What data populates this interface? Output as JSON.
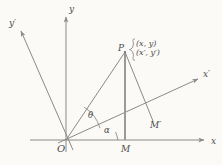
{
  "figure": {
    "type": "geometry-diagram",
    "background_color": "#fbfaf7",
    "stroke_color": "#8a8a8a",
    "text_color": "#4a4a4a"
  },
  "axes": [
    {
      "id": "x",
      "label": "x",
      "kind": "original-horizontal"
    },
    {
      "id": "y",
      "label": "y",
      "kind": "original-vertical"
    },
    {
      "id": "xp",
      "label": "x′",
      "kind": "rotated-horizontal"
    },
    {
      "id": "yp",
      "label": "y′",
      "kind": "rotated-vertical"
    }
  ],
  "points": {
    "origin": {
      "label": "O"
    },
    "P": {
      "label": "P"
    },
    "M": {
      "label": "M"
    },
    "Mprime": {
      "label": "M′"
    }
  },
  "coordinates": {
    "unprimed": "(x,  y)",
    "primed": "(x′,  y′)"
  },
  "angles": {
    "theta": {
      "label": "θ",
      "between": "OP and Ox′"
    },
    "alpha": {
      "label": "α",
      "between": "Ox′ and Ox"
    }
  }
}
